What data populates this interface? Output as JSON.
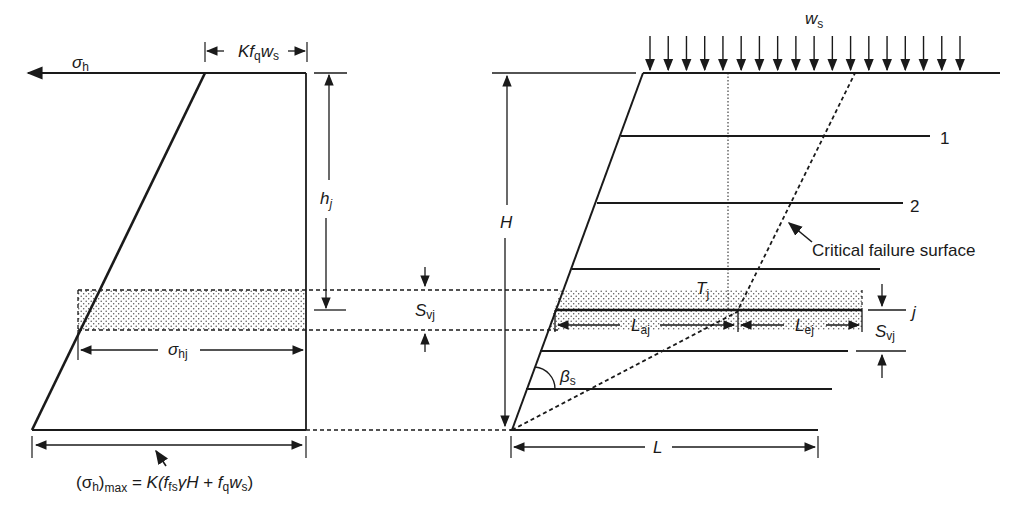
{
  "figure": {
    "type": "mechanically stabilized earth wall analysis diagram",
    "colors": {
      "ink": "#1a1a1a",
      "background": "#ffffff",
      "hatch": "#555555"
    }
  },
  "left_diagram": {
    "sigma_h": {
      "base": "σ",
      "sub": "h"
    },
    "surcharge_width": {
      "K": "K",
      "f": "f",
      "f_sub": "q",
      "w": "w",
      "w_sub": "s"
    },
    "h_j": {
      "base": "h",
      "sub": "j"
    },
    "sigma_hj": {
      "base": "σ",
      "sub": "hj"
    },
    "max_formula": {
      "open": "(σ",
      "h_sub": "h",
      "close": ")",
      "max_sub": "max",
      "eq": " = ",
      "K": "K(",
      "f1": "f",
      "f1_sub": "fs",
      "gamma_H": "γH",
      "plus": " + ",
      "f2": "f",
      "f2_sub": "q",
      "w": "w",
      "w_sub": "s",
      "end": ")"
    }
  },
  "middle": {
    "S_vj": {
      "base": "S",
      "sub": "vj"
    }
  },
  "right_diagram": {
    "surcharge": {
      "base": "w",
      "sub": "s",
      "arrow_count": 18
    },
    "H": "H",
    "layer_labels": [
      "1",
      "2",
      "j"
    ],
    "critical_failure_surface": "Critical failure surface",
    "T_j": {
      "base": "T",
      "sub": "j"
    },
    "L_aj": {
      "base": "L",
      "sub": "aj"
    },
    "L_ej": {
      "base": "L",
      "sub": "ej"
    },
    "S_vj": {
      "base": "S",
      "sub": "vj"
    },
    "beta_s": {
      "base": "β",
      "sub": "s"
    },
    "L": "L"
  }
}
